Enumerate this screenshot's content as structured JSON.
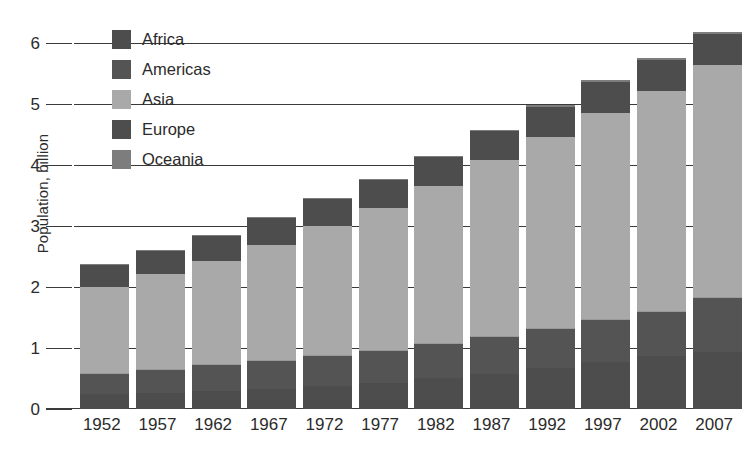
{
  "chart": {
    "type": "bar",
    "title": "",
    "ylabel": "Population, billion",
    "xlabel": ""
  },
  "y_axis": {
    "label": "Population, billion",
    "ticks": [
      "0",
      "1",
      "2",
      "3",
      "4",
      "5",
      "6"
    ]
  },
  "legend": {
    "position": "top-left-inside",
    "items": [
      {
        "label": "Africa",
        "color": "#4d4d4d"
      },
      {
        "label": "Americas",
        "color": "#545454"
      },
      {
        "label": "Asia",
        "color": "#a9a9a9"
      },
      {
        "label": "Europe",
        "color": "#4d4d4d"
      },
      {
        "label": "Oceania",
        "color": "#7d7d7d"
      }
    ]
  },
  "chart_data": {
    "type": "bar",
    "stacked": true,
    "title": "",
    "xlabel": "",
    "ylabel": "Population, billion",
    "ylim": [
      0,
      6.5
    ],
    "yticks": [
      0,
      1,
      2,
      3,
      4,
      5,
      6
    ],
    "grid": true,
    "legend_position": "top-left-inside",
    "categories": [
      "1952",
      "1957",
      "1962",
      "1967",
      "1972",
      "1977",
      "1982",
      "1987",
      "1992",
      "1997",
      "2002",
      "2007"
    ],
    "series": [
      {
        "name": "Africa",
        "color": "#4d4d4d",
        "values": [
          0.24,
          0.26,
          0.3,
          0.33,
          0.38,
          0.43,
          0.5,
          0.58,
          0.67,
          0.77,
          0.87,
          0.93
        ]
      },
      {
        "name": "Americas",
        "color": "#545454",
        "values": [
          0.35,
          0.39,
          0.43,
          0.47,
          0.51,
          0.54,
          0.58,
          0.62,
          0.66,
          0.7,
          0.74,
          0.9
        ]
      },
      {
        "name": "Asia",
        "color": "#a9a9a9",
        "values": [
          1.4,
          1.56,
          1.7,
          1.89,
          2.1,
          2.32,
          2.57,
          2.87,
          3.13,
          3.38,
          3.6,
          3.81
        ]
      },
      {
        "name": "Europe",
        "color": "#4d4d4d",
        "values": [
          0.37,
          0.39,
          0.41,
          0.43,
          0.45,
          0.46,
          0.47,
          0.48,
          0.49,
          0.5,
          0.5,
          0.5
        ]
      },
      {
        "name": "Oceania",
        "color": "#7d7d7d",
        "values": [
          0.01,
          0.01,
          0.01,
          0.02,
          0.02,
          0.02,
          0.02,
          0.02,
          0.02,
          0.03,
          0.03,
          0.03
        ]
      }
    ],
    "totals": [
      2.37,
      2.61,
      2.85,
      3.14,
      3.46,
      3.77,
      4.14,
      4.57,
      4.97,
      5.38,
      5.74,
      6.17
    ]
  }
}
